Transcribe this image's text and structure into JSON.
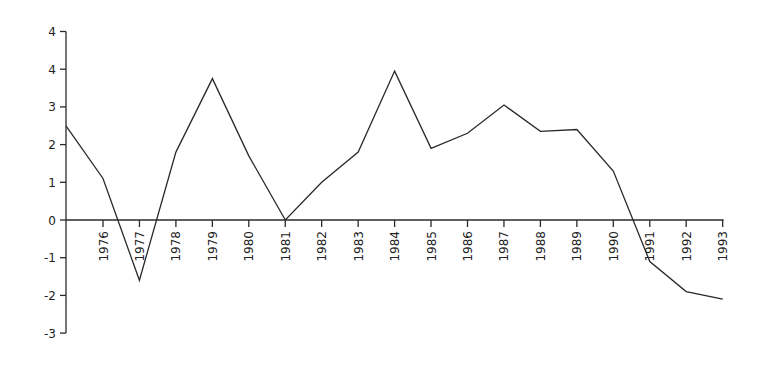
{
  "chart_data": {
    "type": "line",
    "title": "",
    "xlabel": "",
    "ylabel": "",
    "x": [
      "start",
      "1976",
      "1977",
      "1978",
      "1979",
      "1980",
      "1981",
      "1982",
      "1983",
      "1984",
      "1985",
      "1986",
      "1987",
      "1988",
      "1989",
      "1990",
      "1991",
      "1992",
      "1993"
    ],
    "categories": [
      "1976",
      "1977",
      "1978",
      "1979",
      "1980",
      "1981",
      "1982",
      "1983",
      "1984",
      "1985",
      "1986",
      "1987",
      "1988",
      "1989",
      "1990",
      "1991",
      "1992",
      "1993"
    ],
    "series": [
      {
        "name": "series",
        "start_value": 2.5,
        "values": [
          1.1,
          -1.6,
          1.8,
          3.75,
          1.7,
          0.0,
          1.0,
          1.8,
          3.95,
          1.9,
          2.3,
          3.05,
          2.35,
          2.4,
          1.3,
          -1.1,
          -1.9,
          -2.1
        ]
      }
    ],
    "y_ticks": [
      5,
      4,
      3,
      2,
      1,
      0,
      -1,
      -2,
      -3
    ],
    "y_tick_labels": [
      "4",
      "4",
      "3",
      "2",
      "1",
      "0",
      "-1",
      "-2",
      "-3"
    ],
    "ylim": [
      -3,
      5
    ],
    "grid": false,
    "legend": "none",
    "color": "#2a2a2a"
  }
}
